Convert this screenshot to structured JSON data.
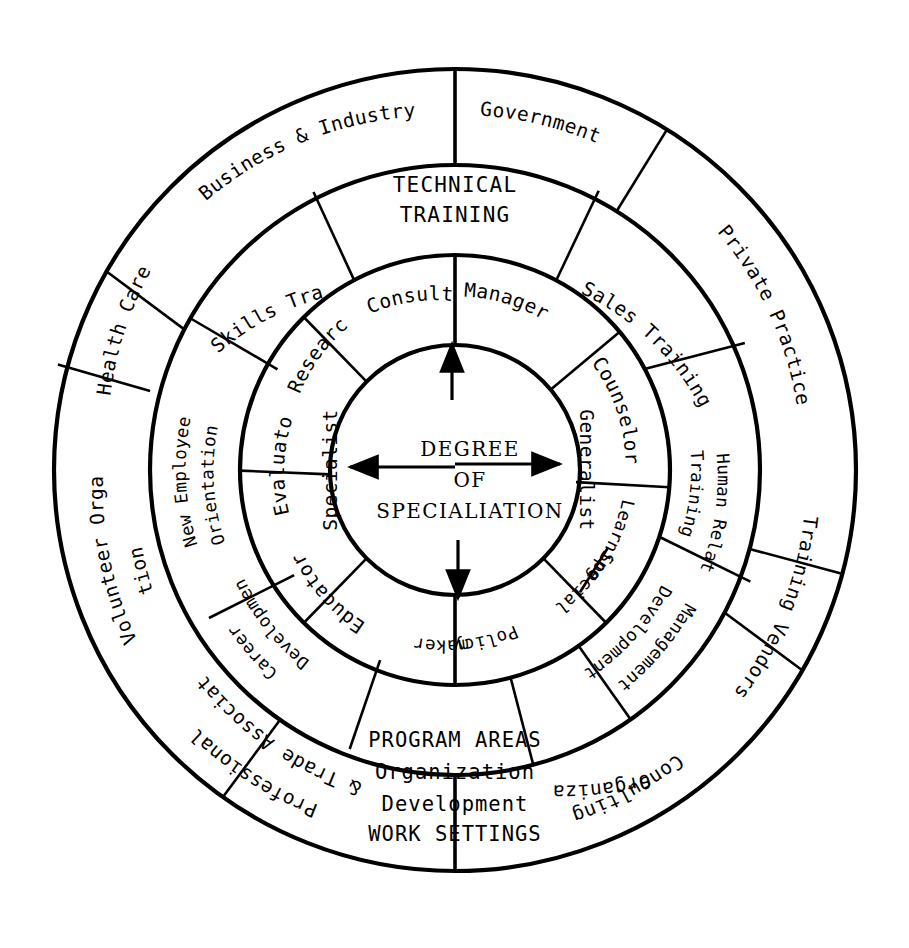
{
  "diagram": {
    "center": {
      "lines": [
        "DEGREE",
        "OF",
        "SPECIALIATION"
      ],
      "axis_labels": {
        "left": "Specialist",
        "right": "Generalist"
      }
    },
    "rings": {
      "inner": {
        "name": "roles-ring",
        "segments": [
          {
            "label": "Manager",
            "start_deg": 0,
            "end_deg": 40
          },
          {
            "label": "Counselor",
            "start_deg": 40,
            "end_deg": 78
          },
          {
            "label": "Learning Specialist",
            "start_deg": 78,
            "end_deg": 135
          },
          {
            "label": "Policy maker",
            "start_deg": 135,
            "end_deg": 180
          },
          {
            "label": "Educator",
            "start_deg": 180,
            "end_deg": 225
          },
          {
            "label": "Evaluator",
            "start_deg": 225,
            "end_deg": 272
          },
          {
            "label": "Researcher",
            "start_deg": 272,
            "end_deg": 315
          },
          {
            "label": "Consultant",
            "start_deg": 315,
            "end_deg": 360
          }
        ]
      },
      "middle": {
        "name": "program-areas-ring",
        "caption": "PROGRAM AREAS",
        "segments": [
          {
            "label": "TECHNICAL TRAINING",
            "start_deg": -28,
            "end_deg": 28,
            "flat": true
          },
          {
            "label": "Sales Training",
            "start_deg": 28,
            "end_deg": 75
          },
          {
            "label": "Human Relations Training",
            "start_deg": 75,
            "end_deg": 125
          },
          {
            "label": "Management Development",
            "start_deg": 125,
            "end_deg": 165
          },
          {
            "label": "Organization Development",
            "start_deg": 165,
            "end_deg": 205,
            "flat": true
          },
          {
            "label": "Career Development",
            "start_deg": 205,
            "end_deg": 248
          },
          {
            "label": "New Employee Orientation",
            "start_deg": 248,
            "end_deg": 297
          },
          {
            "label": "Skills Training",
            "start_deg": 297,
            "end_deg": 332
          }
        ]
      },
      "outer": {
        "name": "work-settings-ring",
        "caption": "WORK SETTINGS",
        "segments": [
          {
            "label": "Government",
            "start_deg": 0,
            "end_deg": 58
          },
          {
            "label": "Private Practice",
            "start_deg": 58,
            "end_deg": 105
          },
          {
            "label": "Training Vendors",
            "start_deg": 105,
            "end_deg": 152
          },
          {
            "label": "Consulting Organization",
            "start_deg": 152,
            "end_deg": 180
          },
          {
            "label": "Professional & Trade Association",
            "start_deg": 180,
            "end_deg": 235
          },
          {
            "label": "Volunteer Organiza- tion",
            "start_deg": 235,
            "end_deg": 285
          },
          {
            "label": "Health Care",
            "start_deg": 285,
            "end_deg": 322
          },
          {
            "label": "Business & Industry",
            "start_deg": 322,
            "end_deg": 360
          }
        ]
      }
    },
    "colors": {
      "stroke": "#000000",
      "background": "#ffffff"
    }
  }
}
